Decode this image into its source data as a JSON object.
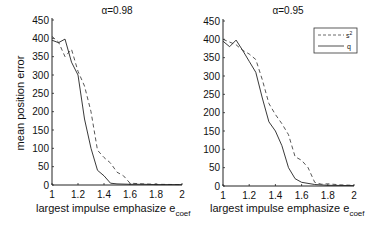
{
  "figure": {
    "ylabel": "mean position error",
    "xlabel_main": "largest impulse emphasize e",
    "xlabel_sub": "coef"
  },
  "legend": {
    "entries": [
      {
        "label": "s",
        "sup": "2",
        "style": "dashed"
      },
      {
        "label": "q",
        "sup": "",
        "style": "solid"
      }
    ]
  },
  "chart_data": [
    {
      "type": "line",
      "title": "α=0.98",
      "xlabel": "largest impulse emphasize e_coef",
      "ylabel": "mean position error",
      "xlim": [
        1,
        2
      ],
      "ylim": [
        0,
        450
      ],
      "xticks": [
        "1",
        "1.2",
        "1.4",
        "1.6",
        "1.8",
        "2"
      ],
      "yticks": [
        "0",
        "50",
        "100",
        "150",
        "200",
        "250",
        "300",
        "350",
        "400",
        "450"
      ],
      "grid": false,
      "series": [
        {
          "name": "s^2",
          "style": "dashed",
          "x": [
            1.0,
            1.05,
            1.1,
            1.15,
            1.2,
            1.25,
            1.3,
            1.35,
            1.4,
            1.45,
            1.5,
            1.55,
            1.6,
            1.7,
            1.8,
            2.0
          ],
          "y": [
            405,
            390,
            350,
            370,
            310,
            270,
            200,
            95,
            75,
            60,
            35,
            25,
            5,
            3,
            2,
            1
          ]
        },
        {
          "name": "q",
          "style": "solid",
          "x": [
            1.0,
            1.05,
            1.1,
            1.15,
            1.2,
            1.25,
            1.3,
            1.35,
            1.4,
            1.45,
            1.5,
            1.6,
            1.7,
            1.8,
            2.0
          ],
          "y": [
            395,
            388,
            398,
            335,
            300,
            180,
            100,
            40,
            25,
            5,
            3,
            2,
            2,
            1,
            1
          ]
        }
      ]
    },
    {
      "type": "line",
      "title": "α=0.95",
      "xlabel": "largest impulse emphasize e_coef",
      "ylabel": "",
      "xlim": [
        1,
        2
      ],
      "ylim": [
        0,
        450
      ],
      "xticks": [
        "1",
        "1.2",
        "1.4",
        "1.6",
        "1.8",
        "2"
      ],
      "yticks": [
        "0",
        "50",
        "100",
        "150",
        "200",
        "250",
        "300",
        "350",
        "400",
        "450"
      ],
      "grid": false,
      "legend_position": "upper right",
      "series": [
        {
          "name": "s^2",
          "style": "dashed",
          "x": [
            1.0,
            1.1,
            1.15,
            1.2,
            1.25,
            1.3,
            1.35,
            1.4,
            1.45,
            1.5,
            1.55,
            1.6,
            1.65,
            1.7,
            1.75,
            1.8,
            1.9,
            2.0
          ],
          "y": [
            400,
            385,
            370,
            360,
            345,
            290,
            225,
            195,
            170,
            140,
            80,
            70,
            50,
            10,
            5,
            6,
            3,
            2
          ]
        },
        {
          "name": "q",
          "style": "solid",
          "x": [
            1.0,
            1.05,
            1.1,
            1.15,
            1.2,
            1.25,
            1.3,
            1.35,
            1.4,
            1.45,
            1.5,
            1.55,
            1.6,
            1.7,
            1.8,
            2.0
          ],
          "y": [
            395,
            380,
            398,
            370,
            340,
            310,
            240,
            175,
            150,
            110,
            50,
            20,
            10,
            4,
            2,
            1
          ]
        }
      ]
    }
  ]
}
